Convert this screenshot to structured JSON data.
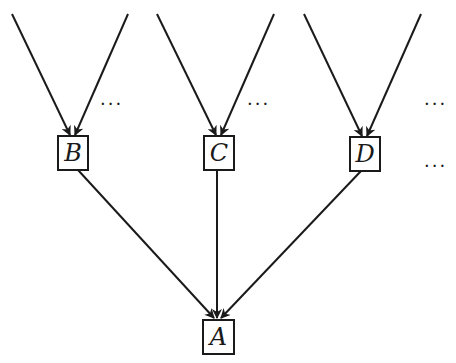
{
  "diagram": {
    "type": "tree",
    "colors": {
      "stroke": "#1a1a1a",
      "background": "#ffffff"
    },
    "nodes": [
      {
        "id": "B",
        "label": "B",
        "x": 58,
        "y": 136,
        "w": 30,
        "h": 34
      },
      {
        "id": "C",
        "label": "C",
        "x": 204,
        "y": 136,
        "w": 30,
        "h": 34
      },
      {
        "id": "D",
        "label": "D",
        "x": 350,
        "y": 137,
        "w": 30,
        "h": 34
      },
      {
        "id": "A",
        "label": "A",
        "x": 203,
        "y": 320,
        "w": 31,
        "h": 34
      }
    ],
    "edges": [
      {
        "from": "top-1",
        "to": "B",
        "x1": 12,
        "y1": 14,
        "x2": 70,
        "y2": 135
      },
      {
        "from": "top-2",
        "to": "B",
        "x1": 128,
        "y1": 14,
        "x2": 75,
        "y2": 135
      },
      {
        "from": "top-3",
        "to": "C",
        "x1": 157,
        "y1": 14,
        "x2": 216,
        "y2": 135
      },
      {
        "from": "top-4",
        "to": "C",
        "x1": 274,
        "y1": 14,
        "x2": 221,
        "y2": 135
      },
      {
        "from": "top-5",
        "to": "D",
        "x1": 304,
        "y1": 14,
        "x2": 362,
        "y2": 136
      },
      {
        "from": "top-6",
        "to": "D",
        "x1": 421,
        "y1": 14,
        "x2": 367,
        "y2": 136
      },
      {
        "from": "B",
        "to": "A",
        "x1": 78,
        "y1": 170,
        "x2": 214,
        "y2": 318
      },
      {
        "from": "C",
        "to": "A",
        "x1": 217,
        "y1": 170,
        "x2": 217,
        "y2": 318
      },
      {
        "from": "D",
        "to": "A",
        "x1": 361,
        "y1": 171,
        "x2": 221,
        "y2": 318
      }
    ],
    "ellipses": [
      {
        "text": "···",
        "x": 100,
        "y": 110
      },
      {
        "text": "···",
        "x": 247,
        "y": 110
      },
      {
        "text": "···",
        "x": 424,
        "y": 110
      },
      {
        "text": "···",
        "x": 424,
        "y": 172
      }
    ]
  }
}
